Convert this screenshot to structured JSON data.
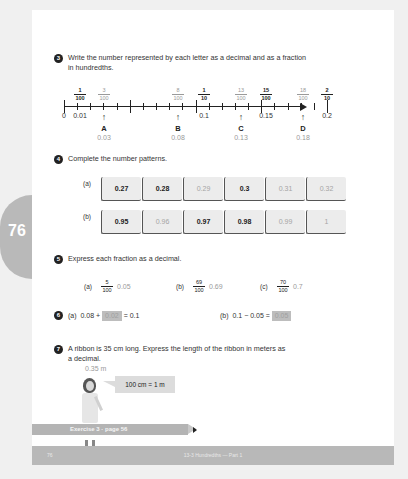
{
  "side_tab": {
    "page_number": "76"
  },
  "q3": {
    "number": "3",
    "text_line1": "Write the number represented by each letter as a decimal and as a fraction",
    "text_line2": "in hundredths.",
    "top_fractions": [
      {
        "num": "1",
        "den": "100",
        "style": "dark"
      },
      {
        "num": "3",
        "den": "100",
        "style": "light"
      },
      {
        "num": "8",
        "den": "100",
        "style": "light"
      },
      {
        "num": "1",
        "den": "10",
        "style": "dark"
      },
      {
        "num": "13",
        "den": "100",
        "style": "light"
      },
      {
        "num": "15",
        "den": "100",
        "style": "dark"
      },
      {
        "num": "18",
        "den": "100",
        "style": "light"
      },
      {
        "num": "2",
        "den": "10",
        "style": "dark"
      }
    ],
    "axis_labels": [
      "0",
      "0.01",
      "0.1",
      "0.15",
      "0.2"
    ],
    "letters": [
      {
        "letter": "A",
        "answer": "0.03"
      },
      {
        "letter": "B",
        "answer": "0.08"
      },
      {
        "letter": "C",
        "answer": "0.13"
      },
      {
        "letter": "D",
        "answer": "0.18"
      }
    ]
  },
  "q4": {
    "number": "4",
    "text": "Complete the number patterns.",
    "rows": [
      {
        "label": "(a)",
        "boxes": [
          {
            "value": "0.27",
            "type": "given"
          },
          {
            "value": "0.28",
            "type": "given"
          },
          {
            "value": "0.29",
            "type": "answer"
          },
          {
            "value": "0.3",
            "type": "given"
          },
          {
            "value": "0.31",
            "type": "answer"
          },
          {
            "value": "0.32",
            "type": "answer"
          }
        ]
      },
      {
        "label": "(b)",
        "boxes": [
          {
            "value": "0.95",
            "type": "given"
          },
          {
            "value": "0.96",
            "type": "answer"
          },
          {
            "value": "0.97",
            "type": "given"
          },
          {
            "value": "0.98",
            "type": "given"
          },
          {
            "value": "0.99",
            "type": "answer"
          },
          {
            "value": "1",
            "type": "answer"
          }
        ]
      }
    ]
  },
  "q5": {
    "number": "5",
    "text": "Express each fraction as a decimal.",
    "items": [
      {
        "label": "(a)",
        "num": "5",
        "den": "100",
        "answer": "0.05"
      },
      {
        "label": "(b)",
        "num": "69",
        "den": "100",
        "answer": "0.69"
      },
      {
        "label": "(c)",
        "num": "70",
        "den": "100",
        "answer": "0.7"
      }
    ]
  },
  "q6": {
    "number": "6",
    "a": {
      "label": "(a)",
      "pre": "0.08 +",
      "blank": "0.02",
      "post": "= 0.1"
    },
    "b": {
      "label": "(b)",
      "pre": "0.1 − 0.05 =",
      "blank": "0.05",
      "post": ""
    }
  },
  "q7": {
    "number": "7",
    "text_line1": "A ribbon is 35 cm long. Express the length of the ribbon in meters as",
    "text_line2": "a decimal.",
    "answer": "0.35 m",
    "bubble": "100 cm = 1 m"
  },
  "banner": {
    "text": "Exercise 3 · page 56"
  },
  "footer": {
    "page_number": "76",
    "title": "13-3 Hundredths — Part 1"
  }
}
